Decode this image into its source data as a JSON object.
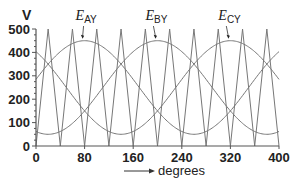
{
  "chart_data": {
    "type": "line",
    "title": "",
    "xlabel": "degrees",
    "ylabel": "V",
    "xlim": [
      0,
      400
    ],
    "ylim": [
      0,
      500
    ],
    "x_ticks": [
      0,
      80,
      160,
      240,
      320,
      400
    ],
    "y_ticks": [
      0,
      100,
      200,
      300,
      400,
      500
    ],
    "y_minor_step": 25,
    "grid": false,
    "legend": "inline annotations",
    "series": [
      {
        "name": "E_AY",
        "label_main": "E",
        "label_sub": "AY",
        "kind": "sinusoid",
        "offset": 250,
        "amplitude": 200,
        "peak_at_deg": 80,
        "period_deg": 360,
        "label_x_deg": 75,
        "label_y": 495,
        "arrow_to_deg": 80
      },
      {
        "name": "E_BY",
        "label_main": "E",
        "label_sub": "BY",
        "kind": "sinusoid",
        "offset": 250,
        "amplitude": 200,
        "peak_at_deg": 200,
        "period_deg": 360,
        "label_x_deg": 190,
        "label_y": 495,
        "arrow_to_deg": 200
      },
      {
        "name": "E_CY",
        "label_main": "E",
        "label_sub": "CY",
        "kind": "sinusoid",
        "offset": 250,
        "amplitude": 200,
        "peak_at_deg": 320,
        "period_deg": 360,
        "label_x_deg": 310,
        "label_y": 495,
        "arrow_to_deg": 320
      },
      {
        "name": "carrier",
        "kind": "triangle",
        "min": 0,
        "max": 500,
        "period_deg": 40,
        "start_value": 0,
        "points": [
          [
            0,
            0
          ],
          [
            20,
            500
          ],
          [
            40,
            0
          ],
          [
            60,
            500
          ],
          [
            80,
            0
          ],
          [
            100,
            500
          ],
          [
            120,
            0
          ],
          [
            140,
            500
          ],
          [
            160,
            0
          ],
          [
            180,
            500
          ],
          [
            200,
            0
          ],
          [
            220,
            500
          ],
          [
            240,
            0
          ],
          [
            260,
            500
          ],
          [
            280,
            0
          ],
          [
            300,
            500
          ],
          [
            320,
            0
          ],
          [
            340,
            500
          ],
          [
            360,
            0
          ],
          [
            380,
            500
          ],
          [
            400,
            0
          ]
        ]
      }
    ]
  },
  "colors": {
    "axis": "#555555",
    "curve": "#777777",
    "text": "#222222"
  }
}
